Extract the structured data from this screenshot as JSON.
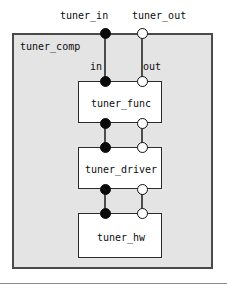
{
  "diagram": {
    "type": "component-port-diagram",
    "component": {
      "name": "tuner_comp",
      "external_ports": [
        {
          "id": "tuner_in",
          "label": "tuner_in",
          "kind": "required",
          "style": "filled-circle",
          "x": 105,
          "y": 33
        },
        {
          "id": "tuner_out",
          "label": "tuner_out",
          "kind": "provided",
          "style": "open-circle",
          "x": 142,
          "y": 33
        }
      ],
      "delegation_labels": [
        {
          "id": "in",
          "label": "in",
          "x": 90,
          "y": 62
        },
        {
          "id": "out",
          "label": "out",
          "x": 143,
          "y": 62
        }
      ]
    },
    "parts": [
      {
        "id": "tuner_func",
        "label": "tuner_func",
        "ports": {
          "top_in": {
            "kind": "required",
            "style": "filled-circle"
          },
          "top_out": {
            "kind": "provided",
            "style": "open-circle"
          },
          "bottom_in": {
            "kind": "required",
            "style": "filled-circle"
          },
          "bottom_out": {
            "kind": "provided",
            "style": "open-circle"
          }
        }
      },
      {
        "id": "tuner_driver",
        "label": "tuner_driver",
        "ports": {
          "top_in": {
            "kind": "required",
            "style": "filled-circle"
          },
          "top_out": {
            "kind": "provided",
            "style": "open-circle"
          },
          "bottom_in": {
            "kind": "required",
            "style": "filled-circle"
          },
          "bottom_out": {
            "kind": "provided",
            "style": "open-circle"
          }
        }
      },
      {
        "id": "tuner_hw",
        "label": "tuner_hw",
        "ports": {
          "top_in": {
            "kind": "required",
            "style": "filled-circle"
          },
          "top_out": {
            "kind": "provided",
            "style": "open-circle"
          }
        }
      }
    ],
    "colors": {
      "component_fill": "#e4e4e4",
      "component_border": "#4a4a4a",
      "part_fill": "#ffffff",
      "part_border": "#2b2b2b",
      "wire": "#4d4d4d",
      "port_required_fill": "#0a0a0a",
      "port_provided_fill": "#ffffff",
      "port_border": "#111111",
      "text": "#0d0d0d",
      "page_background": "#ffffff",
      "rule": "#8a8a8a"
    }
  }
}
